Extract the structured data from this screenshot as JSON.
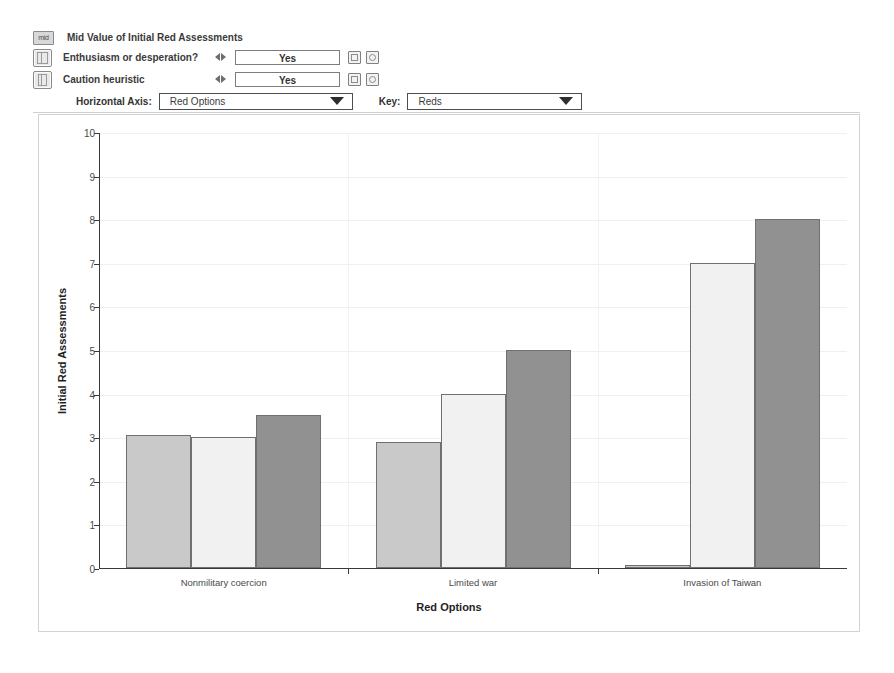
{
  "controls": {
    "panel_title": "Mid Value of Initial Red Assessments",
    "mid_icon_label": "mid",
    "rows": [
      {
        "label": "Enthusiasm or desperation?",
        "value": "Yes"
      },
      {
        "label": "Caution heuristic",
        "value": "Yes"
      }
    ],
    "horizontal_axis_label": "Horizontal Axis:",
    "horizontal_axis_value": "Red Options",
    "key_label": "Key:",
    "key_value": "Reds"
  },
  "chart_data": {
    "type": "bar",
    "title": "",
    "xlabel": "Red Options",
    "ylabel": "Initial Red Assessments",
    "categories": [
      "Nonmilitary coercion",
      "Limited war",
      "Invasion of Taiwan"
    ],
    "ylim": [
      0,
      10
    ],
    "yticks": [
      0,
      1,
      2,
      3,
      4,
      5,
      6,
      7,
      8,
      9,
      10
    ],
    "grid": true,
    "legend_title": "Reds",
    "legend_position": "bottom",
    "series": [
      {
        "name": "A Cautious Realist",
        "color": "#c9c9c9",
        "values": [
          3.05,
          2.9,
          0.07
        ]
      },
      {
        "name": "B Accomplished gambler",
        "color": "#f1f1f1",
        "values": [
          3.0,
          4.0,
          7.0
        ]
      },
      {
        "name": "D Disdainful optimist",
        "color": "#919191",
        "values": [
          3.5,
          5.0,
          8.0
        ]
      }
    ]
  }
}
